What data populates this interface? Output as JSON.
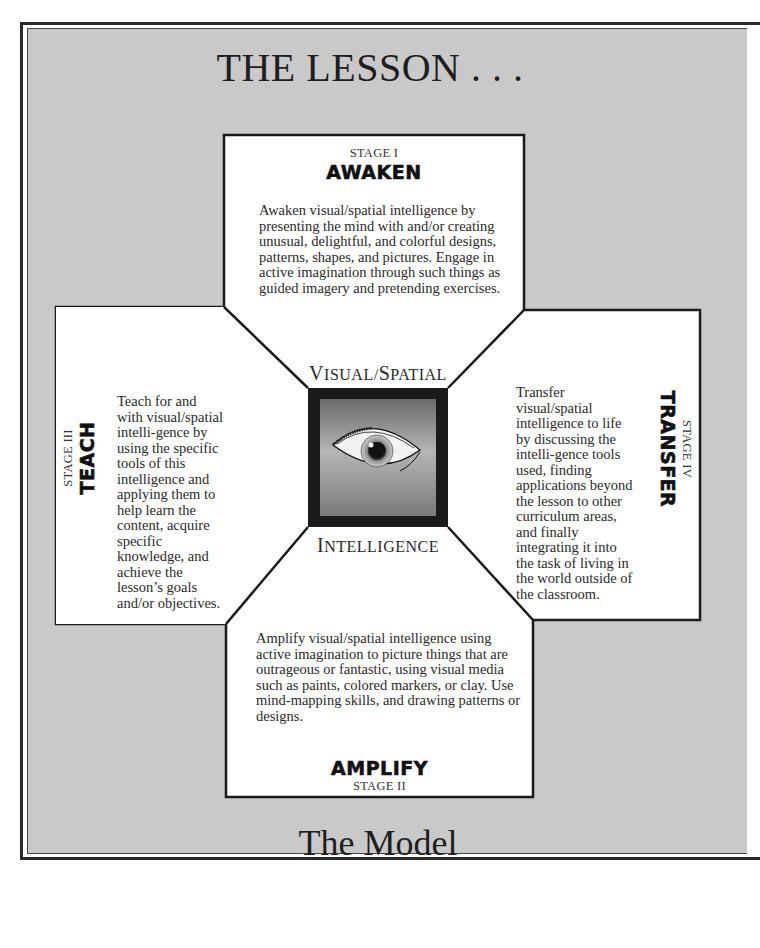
{
  "title": "THE LESSON . . .",
  "subtitle": "The Model",
  "center": {
    "top_label_cap1": "V",
    "top_label_rest1": "ISUAL/",
    "top_label_cap2": "S",
    "top_label_rest2": "PATIAL",
    "bottom_label_cap": "I",
    "bottom_label_rest": "NTELLIGENCE",
    "icon": "eye-icon"
  },
  "stages": {
    "awaken": {
      "stage": "STAGE I",
      "name": "AWAKEN",
      "text": "Awaken visual/spatial intelligence by presenting the mind with and/or creating unusual, delightful, and colorful designs, patterns, shapes, and pictures. Engage in active imagination through such things as guided imagery and pretending exercises."
    },
    "amplify": {
      "stage": "STAGE II",
      "name": "AMPLIFY",
      "text": "Amplify visual/spatial intelligence using active imagination to picture things that are outrageous or fantastic, using visual media such as paints, colored markers, or clay. Use mind-mapping skills, and drawing patterns or designs."
    },
    "teach": {
      "stage": "STAGE III",
      "name": "TEACH",
      "text": "Teach for and with visual/spatial intelli-gence by using the specific tools of this intelligence and applying them to help learn the content, acquire specific knowledge, and achieve the lesson’s goals and/or objectives."
    },
    "transfer": {
      "stage": "STAGE IV",
      "name": "TRANSFER",
      "text": "Transfer visual/spatial intelligence to life by discussing the intelli-gence tools used, finding applications beyond the lesson to other curriculum areas, and finally integrating it into the task of living in the world outside of the classroom."
    }
  },
  "colors": {
    "background": "#c9c9c9",
    "panel": "#ffffff",
    "outline": "#1a1a1a",
    "center_frame": "#1a1a1a"
  }
}
